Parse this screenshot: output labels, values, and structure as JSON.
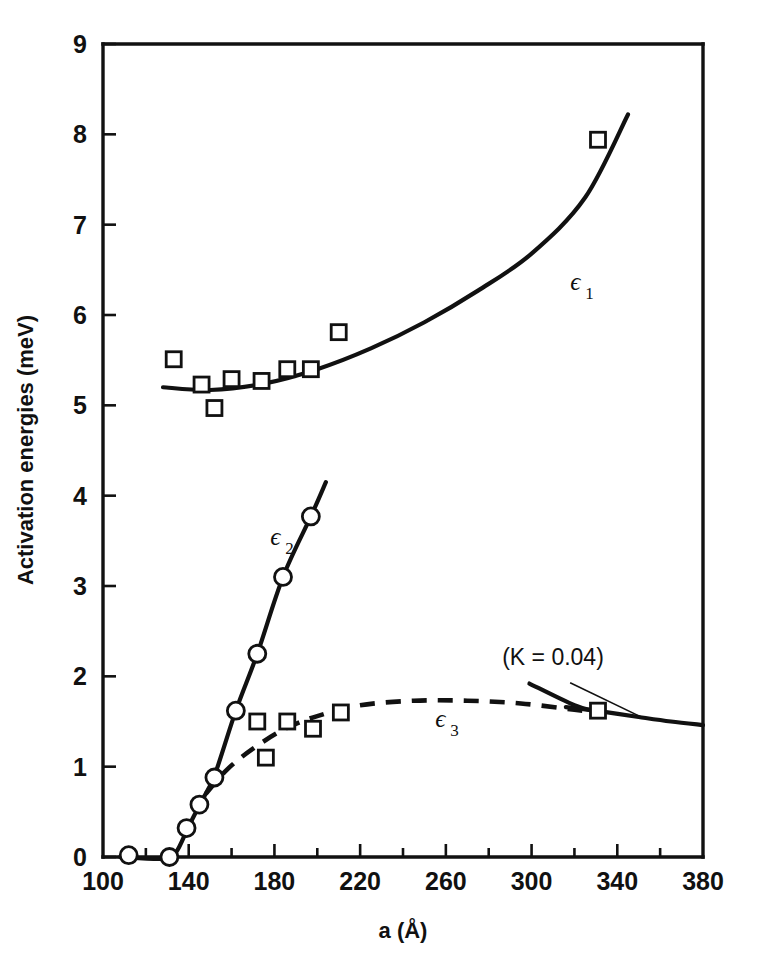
{
  "figure": {
    "background": "#ffffff",
    "ink_color": "#111111"
  },
  "chart_data": {
    "type": "scatter",
    "title": "",
    "subtitle": "",
    "xlabel": "a (Å)",
    "ylabel": "Activation energies (meV)",
    "xlim": [
      100,
      380
    ],
    "ylim": [
      0,
      9
    ],
    "grid": false,
    "legend_position": "inline-annotations",
    "x_ticks_major": [
      100,
      140,
      180,
      220,
      260,
      300,
      340,
      380
    ],
    "x_ticks_minor": [
      120,
      160,
      200,
      240,
      280,
      320,
      360
    ],
    "x_tick_labels": [
      "100",
      "140",
      "180",
      "220",
      "260",
      "300",
      "340",
      "380"
    ],
    "y_ticks": [
      0,
      1,
      2,
      3,
      4,
      5,
      6,
      7,
      8,
      9
    ],
    "y_tick_labels": [
      "0",
      "1",
      "2",
      "3",
      "4",
      "5",
      "6",
      "7",
      "8",
      "9"
    ],
    "series": [
      {
        "name": "ε1",
        "label": "ϵ",
        "label_sub": "1",
        "marker": "open-square",
        "line": "solid",
        "label_x": 318,
        "label_y": 6.28,
        "points": [
          {
            "x": 133,
            "y": 5.51
          },
          {
            "x": 146,
            "y": 5.23
          },
          {
            "x": 152,
            "y": 4.97
          },
          {
            "x": 160,
            "y": 5.29
          },
          {
            "x": 174,
            "y": 5.27
          },
          {
            "x": 186,
            "y": 5.4
          },
          {
            "x": 197,
            "y": 5.4
          },
          {
            "x": 210,
            "y": 5.81
          },
          {
            "x": 331,
            "y": 7.94
          }
        ],
        "curve": [
          {
            "x": 128,
            "y": 5.2
          },
          {
            "x": 150,
            "y": 5.17
          },
          {
            "x": 175,
            "y": 5.24
          },
          {
            "x": 200,
            "y": 5.4
          },
          {
            "x": 225,
            "y": 5.63
          },
          {
            "x": 250,
            "y": 5.92
          },
          {
            "x": 275,
            "y": 6.27
          },
          {
            "x": 300,
            "y": 6.68
          },
          {
            "x": 325,
            "y": 7.3
          },
          {
            "x": 345,
            "y": 8.22
          }
        ]
      },
      {
        "name": "ε2",
        "label": "ϵ",
        "label_sub": "2",
        "marker": "open-circle",
        "line": "solid",
        "label_x": 178,
        "label_y": 3.45,
        "points": [
          {
            "x": 112,
            "y": 0.02
          },
          {
            "x": 131,
            "y": 0.0
          },
          {
            "x": 139,
            "y": 0.32
          },
          {
            "x": 145,
            "y": 0.58
          },
          {
            "x": 152,
            "y": 0.88
          },
          {
            "x": 162,
            "y": 1.62
          },
          {
            "x": 172,
            "y": 2.25
          },
          {
            "x": 184,
            "y": 3.1
          },
          {
            "x": 197,
            "y": 3.77
          }
        ],
        "curve": [
          {
            "x": 108,
            "y": 0.0
          },
          {
            "x": 128,
            "y": -0.02
          },
          {
            "x": 134,
            "y": 0.05
          },
          {
            "x": 140,
            "y": 0.34
          },
          {
            "x": 146,
            "y": 0.62
          },
          {
            "x": 152,
            "y": 0.9
          },
          {
            "x": 162,
            "y": 1.62
          },
          {
            "x": 172,
            "y": 2.25
          },
          {
            "x": 184,
            "y": 3.1
          },
          {
            "x": 197,
            "y": 3.77
          },
          {
            "x": 204,
            "y": 4.15
          }
        ]
      },
      {
        "name": "ε3",
        "label": "ϵ",
        "label_sub": "3",
        "marker": "open-square",
        "line": "dashed",
        "label_x": 255,
        "label_y": 1.44,
        "points": [
          {
            "x": 172,
            "y": 1.5
          },
          {
            "x": 176,
            "y": 1.1
          },
          {
            "x": 186,
            "y": 1.5
          },
          {
            "x": 198,
            "y": 1.42
          },
          {
            "x": 211,
            "y": 1.6
          },
          {
            "x": 331,
            "y": 1.62
          }
        ],
        "curve": [
          {
            "x": 148,
            "y": 0.7
          },
          {
            "x": 158,
            "y": 0.97
          },
          {
            "x": 170,
            "y": 1.2
          },
          {
            "x": 185,
            "y": 1.42
          },
          {
            "x": 200,
            "y": 1.56
          },
          {
            "x": 220,
            "y": 1.68
          },
          {
            "x": 245,
            "y": 1.73
          },
          {
            "x": 270,
            "y": 1.73
          },
          {
            "x": 295,
            "y": 1.7
          },
          {
            "x": 320,
            "y": 1.63
          },
          {
            "x": 333,
            "y": 1.59
          }
        ]
      },
      {
        "name": "tail",
        "marker": "none",
        "line": "solid",
        "curve": [
          {
            "x": 316,
            "y": 1.66
          },
          {
            "x": 330,
            "y": 1.62
          },
          {
            "x": 350,
            "y": 1.55
          },
          {
            "x": 365,
            "y": 1.5
          },
          {
            "x": 380,
            "y": 1.46
          }
        ]
      },
      {
        "name": "k-segment",
        "marker": "none",
        "line": "solid",
        "curve": [
          {
            "x": 299,
            "y": 1.92
          },
          {
            "x": 320,
            "y": 1.68
          },
          {
            "x": 330,
            "y": 1.61
          }
        ]
      }
    ],
    "annotations": [
      {
        "text": "(K = 0.04)",
        "x": 310,
        "y": 2.13,
        "leader_from": {
          "x": 318,
          "y": 1.93
        },
        "leader_to": {
          "x": 352,
          "y": 1.54
        }
      }
    ]
  }
}
